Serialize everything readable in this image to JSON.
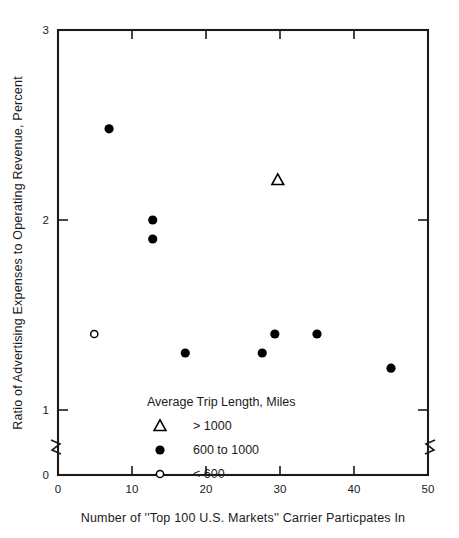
{
  "chart_data": {
    "type": "scatter",
    "title": "",
    "xlabel": "Number of ''Top 100 U.S. Markets'' Carrier Particpates In",
    "ylabel": "Ratio of Advertising Expenses  to Operating Revenue, Percent",
    "xlim": [
      0,
      50
    ],
    "ylim": [
      0,
      3
    ],
    "y_axis_break": true,
    "y_break_between": [
      0,
      1
    ],
    "grid": false,
    "xticks": [
      0,
      10,
      20,
      30,
      40,
      50
    ],
    "xticklabels": [
      "0",
      "10",
      "20",
      "30",
      "40",
      "50"
    ],
    "yticks": [
      0,
      1,
      2,
      3
    ],
    "yticklabels": [
      "0",
      "1",
      "2",
      "3"
    ],
    "legend": {
      "title": "Average Trip Length, Miles",
      "position": "lower-left-inside",
      "entries": [
        {
          "marker": "open-triangle",
          "label": "> 1000"
        },
        {
          "marker": "filled-circle",
          "label": "600 to 1000"
        },
        {
          "marker": "open-circle",
          "label": "< 600"
        }
      ]
    },
    "series": [
      {
        "name": "> 1000",
        "marker": "open-triangle",
        "color": "#000000",
        "points": [
          {
            "x": 29.7,
            "y": 2.21
          }
        ]
      },
      {
        "name": "600 to 1000",
        "marker": "filled-circle",
        "color": "#000000",
        "points": [
          {
            "x": 6.9,
            "y": 2.48
          },
          {
            "x": 12.8,
            "y": 2.0
          },
          {
            "x": 12.8,
            "y": 1.9
          },
          {
            "x": 17.2,
            "y": 1.3
          },
          {
            "x": 27.6,
            "y": 1.3
          },
          {
            "x": 29.3,
            "y": 1.4
          },
          {
            "x": 35.0,
            "y": 1.4
          },
          {
            "x": 45.0,
            "y": 1.22
          }
        ]
      },
      {
        "name": "< 600",
        "marker": "open-circle",
        "color": "#000000",
        "points": [
          {
            "x": 4.9,
            "y": 1.4
          }
        ]
      }
    ]
  }
}
